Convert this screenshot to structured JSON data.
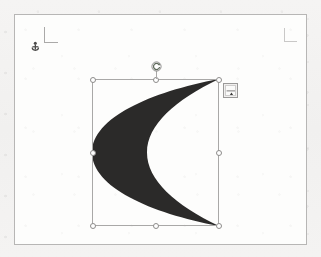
{
  "app": {
    "surface_label": "Document canvas",
    "canvas_color": "#f4f3f2",
    "page_color": "#fdfdfc",
    "page_border_color": "#b7b6b5"
  },
  "page": {
    "label": "Document page"
  },
  "boundary_marks": {
    "top_left_label": "Text boundary corner mark",
    "top_right_label": "Text boundary corner mark",
    "color": "#b2b1b0"
  },
  "anchor": {
    "label": "Object anchor",
    "icon": "anchor-icon",
    "color": "#4a4948"
  },
  "shape": {
    "name": "Moon",
    "type": "crescent",
    "fill_color": "#2b2a29",
    "outline": "none",
    "selected": true,
    "bounds": {
      "left": 92,
      "top": 79,
      "width": 127,
      "height": 147
    }
  },
  "selection": {
    "frame_label": "Selection frame",
    "frame_color": "#a9a8a7",
    "handle_fill": "#ffffff",
    "handle_border": "#8d8c8b",
    "handles": [
      {
        "name": "handle-top-left",
        "x": 0,
        "y": 0
      },
      {
        "name": "handle-top-center",
        "x": 63,
        "y": 0
      },
      {
        "name": "handle-top-right",
        "x": 126,
        "y": 0
      },
      {
        "name": "handle-middle-left",
        "x": 0,
        "y": 73
      },
      {
        "name": "handle-middle-right",
        "x": 126,
        "y": 73
      },
      {
        "name": "handle-bottom-left",
        "x": 0,
        "y": 146
      },
      {
        "name": "handle-bottom-center",
        "x": 63,
        "y": 146
      },
      {
        "name": "handle-bottom-right",
        "x": 126,
        "y": 146
      }
    ],
    "rotate_handle_label": "Rotate shape",
    "rotate_handle_color": "#7d8b79"
  },
  "layout_options": {
    "label": "Layout Options",
    "icon": "layout-options-icon",
    "tooltip": "Layout Options"
  }
}
